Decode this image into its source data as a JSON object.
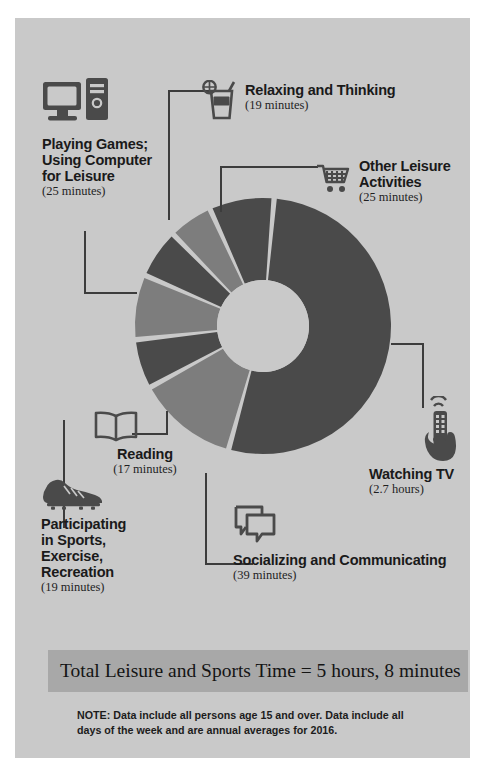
{
  "theme": {
    "page_bg": "#ffffff",
    "panel_bg": "#c9c9c9",
    "slice_dark": "#4a4a4a",
    "slice_light": "#7d7d7d",
    "hole_color": "#c9c9c9",
    "gap_color": "#c9c9c9",
    "banner_bg": "#a8a8a8",
    "text_color": "#1a1a1a",
    "connector_color": "#3c3c3c"
  },
  "labels": {
    "relaxing": {
      "title": "Relaxing and Thinking",
      "value": "(19 minutes)",
      "icon": "drink-glass-icon"
    },
    "other_leisure": {
      "title_line1": "Other Leisure",
      "title_line2": "Activities",
      "value": "(25 minutes)",
      "icon": "shopping-cart-icon"
    },
    "playing_games": {
      "title_line1": "Playing Games;",
      "title_line2": "Using Computer",
      "title_line3": "for Leisure",
      "value": "(25 minutes)",
      "icon": "desktop-computer-icon"
    },
    "watching_tv": {
      "title": "Watching TV",
      "value": "(2.7 hours)",
      "icon": "hand-remote-control-icon"
    },
    "socializing": {
      "title": "Socializing and Communicating",
      "value": "(39 minutes)",
      "icon": "speech-bubbles-icon"
    },
    "reading": {
      "title": "Reading",
      "value": "(17 minutes)",
      "icon": "open-book-icon"
    },
    "sports": {
      "title_line1": "Participating",
      "title_line2": "in Sports,",
      "title_line3": "Exercise,",
      "title_line4": "Recreation",
      "value": "(19 minutes)",
      "icon": "soccer-cleat-icon"
    }
  },
  "footer": {
    "banner_text": "Total Leisure and Sports Time = 5 hours, 8 minutes",
    "note_line1": "NOTE: Data include all persons age 15 and over. Data include all",
    "note_line2": "days of the week and are annual averages for 2016."
  },
  "chart_data": {
    "type": "pie",
    "variant": "donut",
    "title": "Total Leisure and Sports Time = 5 hours, 8 minutes",
    "unit": "minutes per day",
    "total_minutes": 308,
    "center_x": 248,
    "center_y": 308,
    "outer_radius": 128,
    "inner_radius": 46,
    "gap_degrees": 2.4,
    "start_angle_deg": -85,
    "categories": [
      "Watching TV",
      "Socializing and Communicating",
      "Relaxing and Thinking",
      "Playing Games; Using Computer for Leisure",
      "Participating in Sports, Exercise, Recreation",
      "Reading",
      "Other Leisure Activities"
    ],
    "values": [
      162,
      39,
      19,
      25,
      19,
      17,
      25
    ],
    "display_values": [
      "2.7 hours",
      "39 minutes",
      "19 minutes",
      "25 minutes",
      "19 minutes",
      "17 minutes",
      "25 minutes"
    ],
    "colors": [
      "#4a4a4a",
      "#7d7d7d",
      "#4a4a4a",
      "#7d7d7d",
      "#4a4a4a",
      "#7d7d7d",
      "#4a4a4a"
    ],
    "legend": "callout-labels",
    "grid": false
  }
}
